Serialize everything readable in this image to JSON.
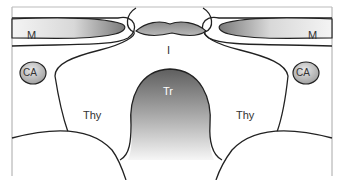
{
  "diagram": {
    "type": "anatomical-cross-section",
    "labels": {
      "muscle_left": "M",
      "muscle_right": "M",
      "carotid_left": "CA",
      "carotid_right": "CA",
      "isthmus": "I",
      "trachea": "Tr",
      "thyroid_left": "Thy",
      "thyroid_right": "Thy"
    },
    "colors": {
      "outline": "#222222",
      "frame": "#9a9a9a",
      "gradient_dark": "#6e6e6e",
      "gradient_light": "#f2f2f2",
      "background": "#ffffff"
    }
  }
}
